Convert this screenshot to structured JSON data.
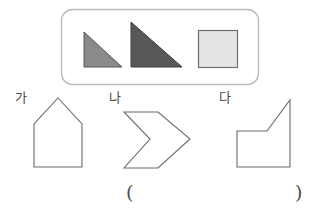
{
  "page": {
    "background_color": "#ffffff",
    "width": 321,
    "height": 216
  },
  "example_box": {
    "name": "rounded-example-box",
    "border_color": "#b9b9b9",
    "fill_color": "#ffffff",
    "x": 61,
    "y": 9,
    "width": 198,
    "height": 76,
    "corner_radius": 11,
    "shapes": [
      {
        "name": "small-gray-right-triangle",
        "type": "right-triangle",
        "fill": "#8a8a8a",
        "stroke": "#595959",
        "points": "84,67 84,32 122,67",
        "right_angle_corner": "bottom-left-vertical-left-edge"
      },
      {
        "name": "large-dark-right-triangle",
        "type": "right-triangle",
        "fill": "#585858",
        "stroke": "#3d3d3d",
        "points": "131,67 131,22 182,67",
        "right_angle_corner": "bottom-left-vertical-left-edge"
      },
      {
        "name": "light-square",
        "type": "square",
        "fill": "#e4e4e4",
        "stroke": "#6f6f6f",
        "x": 198,
        "y": 30,
        "width": 40,
        "height": 38
      }
    ]
  },
  "answer_choices": [
    {
      "id": "ga",
      "label": "가",
      "shape_name": "house-pentagon-outline",
      "shape_type": "pentagon",
      "stroke": "#6b6b6b",
      "fill": "none",
      "points": "58,98 82,124 82,167 34,167 34,124"
    },
    {
      "id": "na",
      "label": "나",
      "shape_name": "left-pointing-chevron-outline",
      "shape_type": "concave-arrow",
      "stroke": "#6b6b6b",
      "fill": "none",
      "points": "158,112 124,112 150,139 124,168 158,168 190,139"
    },
    {
      "id": "da",
      "label": "다",
      "shape_name": "notched-pentagon-outline",
      "shape_type": "pentagon",
      "stroke": "#6b6b6b",
      "fill": "none",
      "points": "290,100 290,167 237,167 237,131 267,131"
    }
  ],
  "answer_field": {
    "name": "answer-blank",
    "open_paren": "(",
    "close_paren": ")"
  }
}
